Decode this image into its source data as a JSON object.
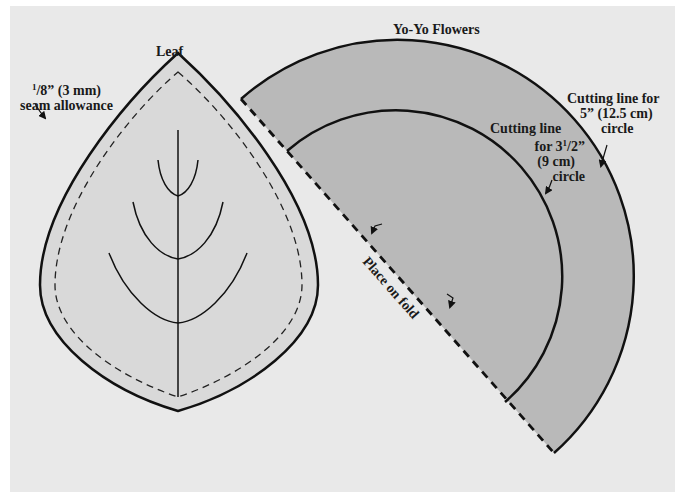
{
  "leaf": {
    "title": "Leaf",
    "seam_line1_num": "1",
    "seam_line1_rest": "/8” (3 mm)",
    "seam_line2": "seam allowance"
  },
  "yoyo": {
    "title": "Yo-Yo Flowers",
    "outer_label": {
      "line1": "Cutting line for",
      "line2": "5” (12.5 cm)",
      "line3": "circle"
    },
    "inner_label": {
      "line1": "Cutting line",
      "line2_pre": "for 3",
      "line2_sup": "1",
      "line2_post": "/2”",
      "line3": "(9 cm)",
      "line4": "circle"
    },
    "fold_label": "Place on fold"
  },
  "colors": {
    "background": "#e9e9e9",
    "leaf_fill": "#d9d9d9",
    "yoyo_fill": "#b9b9b9",
    "line": "#111111"
  }
}
